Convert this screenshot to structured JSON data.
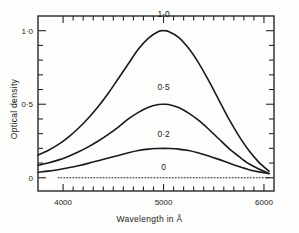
{
  "chart_data": {
    "type": "line",
    "title": "",
    "xlabel": "Wavelength in Å",
    "ylabel": "Optical density",
    "xlim": [
      3750,
      6100
    ],
    "ylim": [
      -0.09,
      1.1
    ],
    "xticks": [
      4000,
      5000,
      6000
    ],
    "xtick_labels": [
      "4000",
      "5000",
      "6000"
    ],
    "xminor_step": 100,
    "yticks": [
      0,
      0.5,
      1.0
    ],
    "ytick_labels": [
      "0",
      "0·5",
      "1·0"
    ],
    "yminor_step": 0.1,
    "grid": false,
    "legend": "inline-curve-labels",
    "frame": "box-all-four-sides-ticks-inward",
    "series": [
      {
        "name": "1·0",
        "label": "1·0",
        "style": "solid",
        "peak_x": 5000,
        "peak_y": 1.0,
        "label_x": 5000,
        "label_y": 1.09,
        "x": [
          3750,
          3850,
          3950,
          4050,
          4150,
          4250,
          4350,
          4450,
          4550,
          4650,
          4750,
          4850,
          4950,
          5000,
          5050,
          5150,
          5250,
          5350,
          5450,
          5550,
          5650,
          5750,
          5850,
          5950,
          6050
        ],
        "y": [
          0.155,
          0.185,
          0.225,
          0.275,
          0.335,
          0.405,
          0.485,
          0.575,
          0.675,
          0.775,
          0.875,
          0.95,
          0.995,
          1.0,
          0.995,
          0.955,
          0.88,
          0.78,
          0.66,
          0.53,
          0.4,
          0.285,
          0.185,
          0.105,
          0.045
        ]
      },
      {
        "name": "0·5",
        "label": "0·5",
        "style": "solid",
        "peak_x": 5000,
        "peak_y": 0.5,
        "label_x": 5000,
        "label_y": 0.595,
        "x": [
          3750,
          3850,
          3950,
          4050,
          4150,
          4250,
          4350,
          4450,
          4550,
          4650,
          4750,
          4850,
          4950,
          5000,
          5050,
          5150,
          5250,
          5350,
          5450,
          5550,
          5650,
          5750,
          5850,
          5950,
          6050
        ],
        "y": [
          0.085,
          0.1,
          0.12,
          0.145,
          0.175,
          0.21,
          0.25,
          0.295,
          0.345,
          0.4,
          0.445,
          0.48,
          0.498,
          0.5,
          0.498,
          0.478,
          0.44,
          0.39,
          0.33,
          0.265,
          0.2,
          0.145,
          0.095,
          0.06,
          0.03
        ]
      },
      {
        "name": "0·2",
        "label": "0·2",
        "style": "solid",
        "peak_x": 5000,
        "peak_y": 0.2,
        "label_x": 5000,
        "label_y": 0.275,
        "x": [
          3750,
          3850,
          3950,
          4050,
          4150,
          4250,
          4350,
          4450,
          4550,
          4650,
          4750,
          4850,
          4950,
          5000,
          5050,
          5150,
          5250,
          5350,
          5450,
          5550,
          5650,
          5750,
          5850,
          5950,
          6050
        ],
        "y": [
          0.038,
          0.045,
          0.055,
          0.068,
          0.082,
          0.098,
          0.116,
          0.134,
          0.152,
          0.17,
          0.185,
          0.195,
          0.199,
          0.2,
          0.199,
          0.195,
          0.185,
          0.168,
          0.148,
          0.125,
          0.1,
          0.076,
          0.055,
          0.04,
          0.028
        ]
      },
      {
        "name": "0",
        "label": "0",
        "style": "dotted",
        "peak_x": 5000,
        "peak_y": 0.0,
        "label_x": 5000,
        "label_y": 0.055,
        "x": [
          3950,
          6050
        ],
        "y": [
          0.0,
          0.0
        ]
      }
    ]
  },
  "axes": {
    "y_title": "Optical density",
    "x_title": "Wavelength in Å",
    "x_tick_labels": [
      "4000",
      "5000",
      "6000"
    ],
    "y_tick_labels": [
      "1·0",
      "0·5",
      "0"
    ],
    "curve_labels": [
      "1·0",
      "0·5",
      "0·2",
      "0"
    ]
  }
}
